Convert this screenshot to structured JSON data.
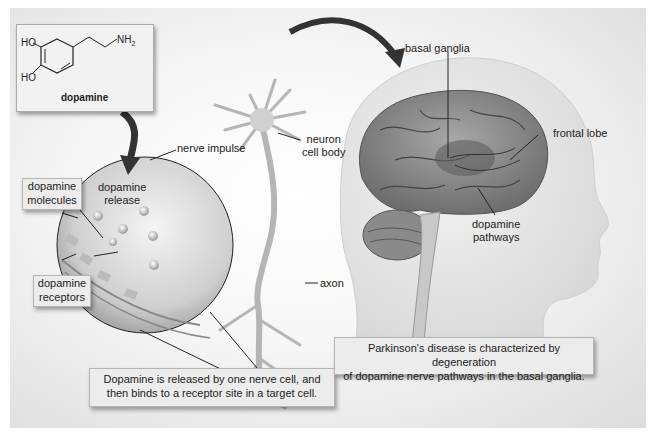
{
  "chemical_structure": {
    "name": "dopamine",
    "groups": {
      "hydroxyl_top": "HO",
      "hydroxyl_bottom": "HO",
      "amine": "NH",
      "amine_subscript": "2"
    }
  },
  "synapse_inset": {
    "labels": {
      "nerve_impulse": "nerve impulse",
      "dopamine_release_line1": "dopamine",
      "dopamine_release_line2": "release"
    },
    "boxes": {
      "dopamine_molecules_line1": "dopamine",
      "dopamine_molecules_line2": "molecules",
      "dopamine_receptors_line1": "dopamine",
      "dopamine_receptors_line2": "receptors"
    }
  },
  "neuron": {
    "labels": {
      "cell_body_line1": "neuron",
      "cell_body_line2": "cell body",
      "axon": "axon"
    }
  },
  "brain": {
    "labels": {
      "basal_ganglia": "basal ganglia",
      "frontal_lobe": "frontal lobe",
      "dopamine_pathways_line1": "dopamine",
      "dopamine_pathways_line2": "pathways"
    }
  },
  "captions": {
    "release_line1": "Dopamine is released by one nerve cell, and",
    "release_line2": "then binds to a receptor site in a target cell.",
    "parkinsons_line1": "Parkinson's disease is characterized by degeneration",
    "parkinsons_line2": "of dopamine nerve pathways in the basal ganglia."
  },
  "colors": {
    "brain": "#8a8a8a",
    "head": "#e8e8e8",
    "arrow": "#333333",
    "box_bg": "#ececec"
  }
}
